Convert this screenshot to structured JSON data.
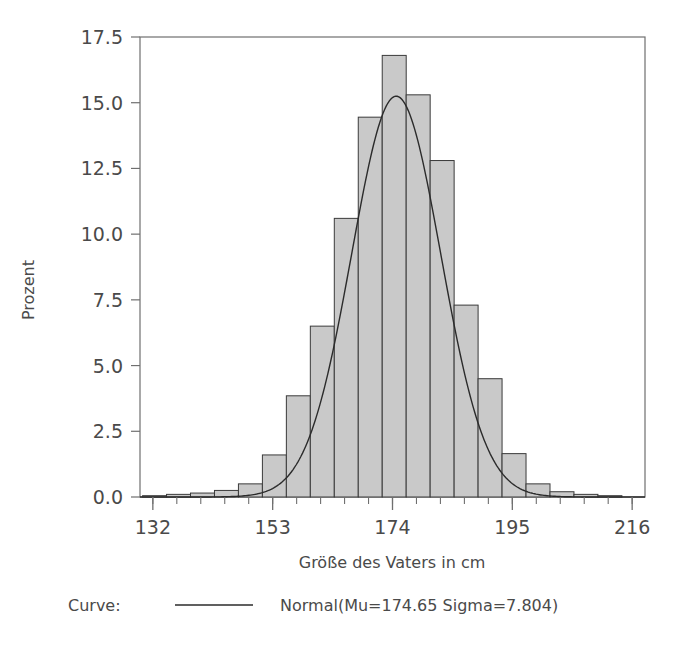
{
  "chart_data": {
    "type": "bar",
    "title": "",
    "subtitle": "",
    "xlabel": "Größe des Vaters in cm",
    "ylabel": "Prozent",
    "xlim": [
      129.75,
      218.25
    ],
    "ylim": [
      0,
      17.5
    ],
    "grid": false,
    "legend_position": "below-axis",
    "x_tick_labels": [
      "132",
      "153",
      "174",
      "195",
      "216"
    ],
    "x_tick_values": [
      132,
      153,
      174,
      195,
      216
    ],
    "x_minor_tick_step": 4.2,
    "y_tick_labels": [
      "0.0",
      "2.5",
      "5.0",
      "7.5",
      "10.0",
      "12.5",
      "15.0",
      "17.5"
    ],
    "y_tick_values": [
      0.0,
      2.5,
      5.0,
      7.5,
      10.0,
      12.5,
      15.0,
      17.5
    ],
    "bin_width": 4.2,
    "bar_fill": "#c9c9c9",
    "bar_stroke": "#3a3a3a",
    "curve_color": "#2b2b2b",
    "categories": [
      "132.3",
      "136.5",
      "140.7",
      "144.9",
      "149.1",
      "153.3",
      "157.5",
      "161.7",
      "165.9",
      "170.1",
      "174.3",
      "178.5",
      "182.7",
      "186.9",
      "191.1",
      "195.3",
      "199.5",
      "203.7",
      "207.9",
      "212.1"
    ],
    "bin_centers": [
      132.3,
      136.5,
      140.7,
      144.9,
      149.1,
      153.3,
      157.5,
      161.7,
      165.9,
      170.1,
      174.3,
      178.5,
      182.7,
      186.9,
      191.1,
      195.3,
      199.5,
      203.7,
      207.9,
      212.1
    ],
    "values": [
      0.05,
      0.1,
      0.15,
      0.25,
      0.5,
      1.6,
      3.85,
      6.5,
      10.6,
      14.45,
      16.8,
      15.3,
      12.8,
      7.3,
      4.5,
      1.65,
      0.5,
      0.2,
      0.1,
      0.05
    ],
    "series": [
      {
        "name": "Prozent",
        "values": [
          0.05,
          0.1,
          0.15,
          0.25,
          0.5,
          1.6,
          3.85,
          6.5,
          10.6,
          14.45,
          16.8,
          15.3,
          12.8,
          7.3,
          4.5,
          1.65,
          0.5,
          0.2,
          0.1,
          0.05
        ]
      }
    ],
    "overlay_curve": {
      "name": "Normal(Mu=174.65 Sigma=7.804)",
      "distribution": "normal",
      "mu": 174.65,
      "sigma": 7.804,
      "peak_value": 15.25,
      "scale_note": "density scaled so peak height is about 15.25 percent"
    }
  },
  "legend": {
    "label": "Curve:",
    "entry": "Normal(Mu=174.65 Sigma=7.804)"
  },
  "axes": {
    "x_title": "Größe des Vaters in cm",
    "y_title": "Prozent"
  }
}
